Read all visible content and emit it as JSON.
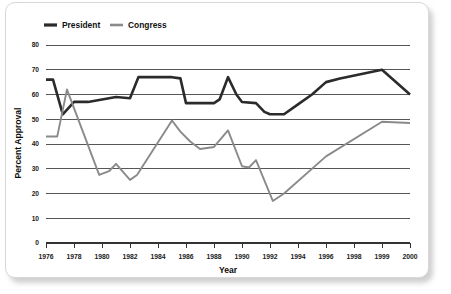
{
  "chart_data": {
    "type": "line",
    "title": "",
    "xlabel": "Year",
    "ylabel": "Percent Approval",
    "xlim": [
      1976,
      2000
    ],
    "ylim": [
      0,
      80
    ],
    "yticks": [
      0,
      10,
      20,
      30,
      40,
      50,
      60,
      70,
      80
    ],
    "xticks": [
      1976,
      1978,
      1980,
      1982,
      1984,
      1986,
      1988,
      1990,
      1992,
      1994,
      1996,
      1998,
      1999,
      2000
    ],
    "xtick_labels": [
      "1976",
      "1978",
      "1980",
      "1982",
      "1984",
      "1986",
      "1988",
      "1990",
      "1992",
      "1994",
      "1996",
      "1998",
      "1999",
      "2000"
    ],
    "ytick_labels": [
      "0",
      "10",
      "20",
      "30",
      "40",
      "50",
      "60",
      "70",
      "80"
    ],
    "grid": "horizontal",
    "legend_position": "top-left",
    "series": [
      {
        "name": "President",
        "color": "#2b2b2b",
        "x": [
          1976,
          1976.5,
          1977.2,
          1978,
          1979,
          1980,
          1981,
          1982,
          1982.6,
          1985,
          1985.6,
          1986,
          1988,
          1988.4,
          1989,
          1989.6,
          1990,
          1991,
          1991.6,
          1992,
          1993,
          1994,
          1995,
          1996,
          1997,
          1999,
          2000
        ],
        "values": [
          66,
          66,
          52,
          57,
          57,
          58,
          59,
          58.5,
          67,
          67,
          66.5,
          56.5,
          56.5,
          58,
          67,
          60,
          57,
          56.5,
          53,
          52,
          52,
          56,
          60,
          65,
          66.5,
          70,
          60
        ]
      },
      {
        "name": "Congress",
        "color": "#8a8a8a",
        "x": [
          1976,
          1976.8,
          1977.5,
          1979.8,
          1980.5,
          1981,
          1982,
          1982.5,
          1985,
          1985.6,
          1986.3,
          1987,
          1988,
          1989,
          1990,
          1990.5,
          1991,
          1992.2,
          1993,
          1996,
          1999,
          2000
        ],
        "values": [
          43,
          43,
          62,
          27.5,
          29,
          32,
          25.5,
          27.5,
          49.5,
          45,
          41,
          38,
          38.8,
          45.5,
          31,
          30.5,
          33.5,
          17,
          20,
          35,
          49,
          48.5
        ]
      }
    ]
  },
  "legend": {
    "entries": [
      {
        "label": "President",
        "color": "#2b2b2b"
      },
      {
        "label": "Congress",
        "color": "#8a8a8a"
      }
    ]
  },
  "axes": {
    "y_title": "Percent Approval",
    "x_title": "Year"
  }
}
